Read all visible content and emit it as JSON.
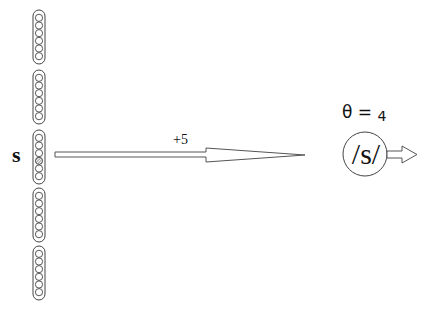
{
  "diagram": {
    "input_label": "s",
    "weight_label": "+5",
    "threshold": {
      "symbol": "θ",
      "equals": "=",
      "value": "4"
    },
    "output_node_label": "/s/",
    "input_columns": [
      {
        "id": 1,
        "circles": 6,
        "active_index": null
      },
      {
        "id": 2,
        "circles": 6,
        "active_index": null
      },
      {
        "id": 3,
        "circles": 6,
        "active_index": 3
      },
      {
        "id": 4,
        "circles": 6,
        "active_index": null
      },
      {
        "id": 5,
        "circles": 6,
        "active_index": null
      }
    ],
    "colors": {
      "stroke": "#333333",
      "arrow_stroke": "#555555",
      "background": "#ffffff"
    }
  }
}
